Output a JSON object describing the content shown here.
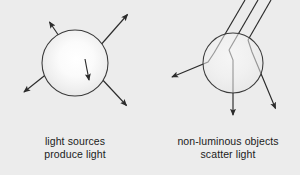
{
  "figure": {
    "background_color": "#ececec",
    "ink_color": "#2b2b2b",
    "panels": [
      {
        "id": "light-source",
        "caption_line1": "light sources",
        "caption_line2": "produce light",
        "object": {
          "kind": "circle",
          "role": "luminous-source",
          "center_x": 75,
          "center_y": 63,
          "radius": 33,
          "fill": "radial-highlight"
        },
        "rays": [
          {
            "name": "ray-up-left",
            "direction": "out",
            "tip_x": 48,
            "tip_y": 20
          },
          {
            "name": "ray-up-right",
            "direction": "out",
            "tip_x": 129,
            "tip_y": 13
          },
          {
            "name": "ray-down-left",
            "direction": "out",
            "tip_x": 22,
            "tip_y": 93
          },
          {
            "name": "ray-down-right",
            "direction": "out",
            "tip_x": 128,
            "tip_y": 107
          },
          {
            "name": "ray-inner-short",
            "direction": "out",
            "tip_x": 89,
            "tip_y": 82
          }
        ]
      },
      {
        "id": "scattering-object",
        "caption_line1": "non-luminous objects",
        "caption_line2": "scatter light",
        "object": {
          "kind": "circle",
          "role": "non-luminous-object",
          "center_x": 233,
          "center_y": 63,
          "radius": 30,
          "fill": "radial-highlight"
        },
        "rays": [
          {
            "name": "incoming-ray-1",
            "direction": "in",
            "entry_x": 245,
            "entry_y": 0
          },
          {
            "name": "incoming-ray-2",
            "direction": "in",
            "entry_x": 258,
            "entry_y": 0
          },
          {
            "name": "incoming-ray-3",
            "direction": "in",
            "entry_x": 271,
            "entry_y": 0
          },
          {
            "name": "scattered-ray-left",
            "direction": "out",
            "tip_x": 170,
            "tip_y": 78
          },
          {
            "name": "scattered-ray-down",
            "direction": "out",
            "tip_x": 233,
            "tip_y": 117
          },
          {
            "name": "scattered-ray-right",
            "direction": "out",
            "tip_x": 277,
            "tip_y": 110
          }
        ]
      }
    ]
  }
}
